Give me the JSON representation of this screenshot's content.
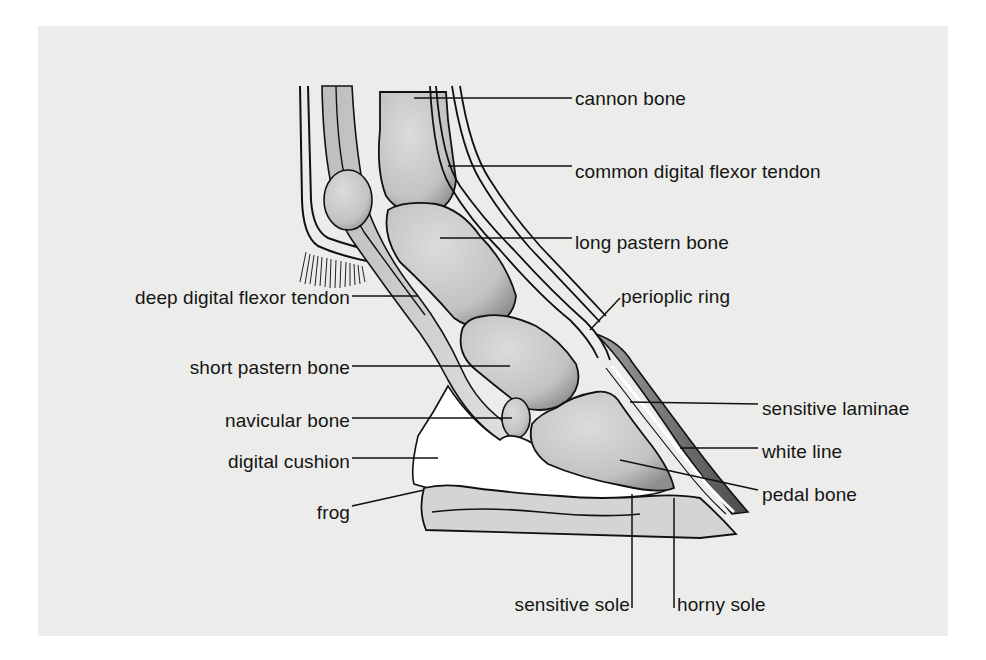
{
  "diagram": {
    "background_color": "#ececea",
    "labels_right": [
      {
        "id": "cannon-bone",
        "text": "cannon bone"
      },
      {
        "id": "common-digital-flexor-tendon",
        "text": "common digital flexor tendon"
      },
      {
        "id": "long-pastern-bone",
        "text": "long pastern bone"
      },
      {
        "id": "perioplic-ring",
        "text": "perioplic ring"
      },
      {
        "id": "sensitive-laminae",
        "text": "sensitive laminae"
      },
      {
        "id": "white-line",
        "text": "white line"
      },
      {
        "id": "pedal-bone",
        "text": "pedal bone"
      }
    ],
    "labels_left": [
      {
        "id": "deep-digital-flexor-tendon",
        "text": "deep digital flexor tendon"
      },
      {
        "id": "short-pastern-bone",
        "text": "short pastern bone"
      },
      {
        "id": "navicular-bone",
        "text": "navicular bone"
      },
      {
        "id": "digital-cushion",
        "text": "digital cushion"
      },
      {
        "id": "frog",
        "text": "frog"
      }
    ],
    "labels_bottom": [
      {
        "id": "sensitive-sole",
        "text": "sensitive sole"
      },
      {
        "id": "horny-sole",
        "text": "horny sole"
      }
    ],
    "colors": {
      "bone_fill": "#c9c9c7",
      "bone_dark": "#9a9a98",
      "wall_fill": "#6e6e6c",
      "sole_fill": "#d6d6d4",
      "cushion_fill": "#ffffff",
      "line": "#111111"
    }
  }
}
